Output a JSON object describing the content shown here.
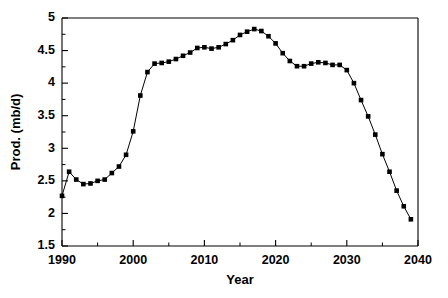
{
  "chart_data": {
    "type": "line",
    "title": "",
    "subtitle": "",
    "xlabel": "Year",
    "ylabel": "Prod. (mb/d)",
    "xlim": [
      1990,
      2040
    ],
    "ylim": [
      1.5,
      5.0
    ],
    "xticks": [
      1990,
      2000,
      2010,
      2020,
      2030,
      2040
    ],
    "xtick_labels": [
      "1990",
      "2000",
      "2010",
      "2020",
      "2030",
      "2040"
    ],
    "xticks_minor": [
      1995,
      2005,
      2015,
      2025,
      2035
    ],
    "yticks": [
      1.5,
      2,
      2.5,
      3,
      3.5,
      4,
      4.5,
      5
    ],
    "ytick_labels": [
      "1.5",
      "2",
      "2.5",
      "3",
      "3.5",
      "4",
      "4.5",
      "5"
    ],
    "yticks_minor": [
      1.75,
      2.25,
      2.75,
      3.25,
      3.75,
      4.25,
      4.75
    ],
    "grid": false,
    "legend": null,
    "marker": "square",
    "marker_color": "#000000",
    "line_color": "#000000",
    "series": [
      {
        "name": "Production",
        "x": [
          1990,
          1991,
          1992,
          1993,
          1994,
          1995,
          1996,
          1997,
          1998,
          1999,
          2000,
          2001,
          2002,
          2003,
          2004,
          2005,
          2006,
          2007,
          2008,
          2009,
          2010,
          2011,
          2012,
          2013,
          2014,
          2015,
          2016,
          2017,
          2018,
          2019,
          2020,
          2021,
          2022,
          2023,
          2024,
          2025,
          2026,
          2027,
          2028,
          2029,
          2030,
          2031,
          2032,
          2033,
          2034,
          2035,
          2036,
          2037,
          2038,
          2039
        ],
        "values": [
          2.27,
          2.64,
          2.52,
          2.45,
          2.46,
          2.5,
          2.52,
          2.62,
          2.72,
          2.9,
          3.26,
          3.81,
          4.17,
          4.3,
          4.31,
          4.33,
          4.37,
          4.42,
          4.47,
          4.54,
          4.55,
          4.53,
          4.55,
          4.6,
          4.66,
          4.74,
          4.79,
          4.83,
          4.8,
          4.72,
          4.61,
          4.46,
          4.34,
          4.26,
          4.26,
          4.3,
          4.32,
          4.31,
          4.28,
          4.28,
          4.2,
          4.0,
          3.74,
          3.49,
          3.21,
          2.91,
          2.64,
          2.35,
          2.11,
          1.91
        ]
      }
    ]
  }
}
